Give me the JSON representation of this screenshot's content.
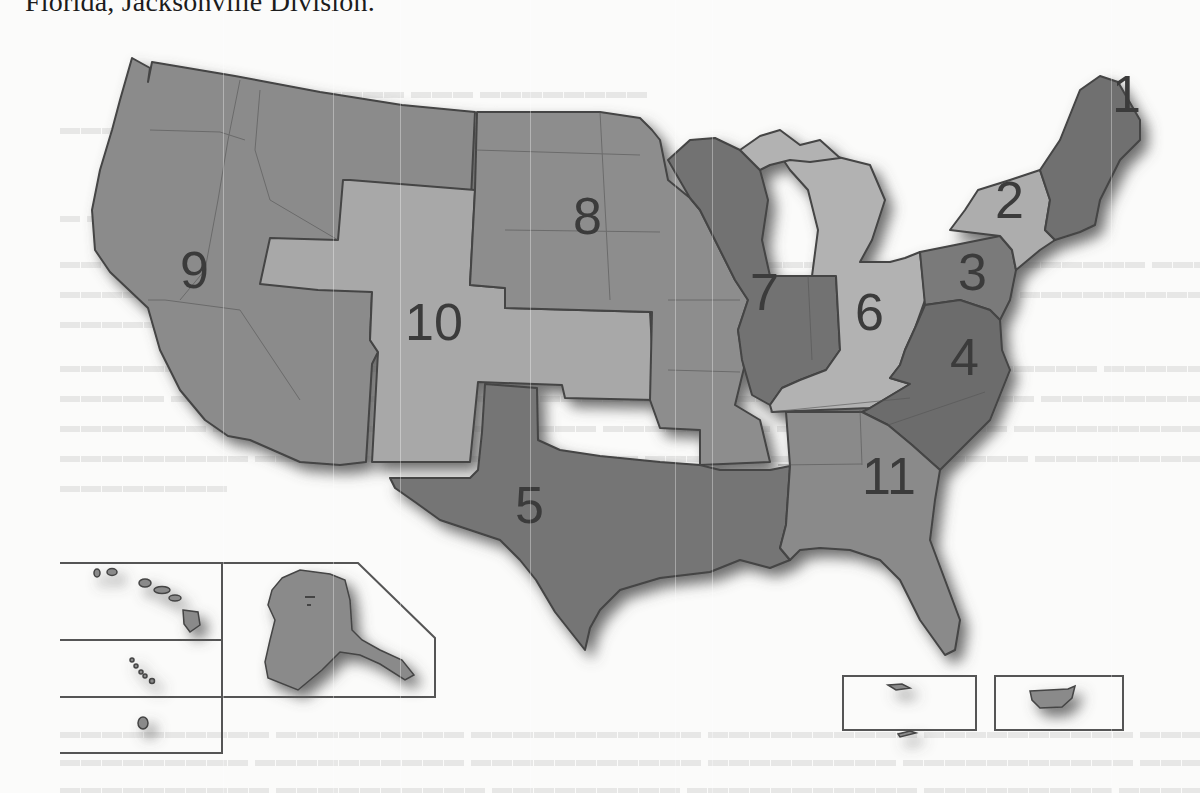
{
  "document": {
    "top_line": "Florida, Jacksonville Division."
  },
  "map": {
    "title": "Geographic Boundaries of the United States Courts of Appeals",
    "colors": {
      "dark": "#6f6f6f",
      "medium": "#8a8a8a",
      "light": "#a9a9a9",
      "border": "#444444",
      "shadow": "#5a5a5a",
      "paper": "#fbfbfa"
    },
    "circuits": [
      {
        "number": "1",
        "shade": "dark"
      },
      {
        "number": "2",
        "shade": "light"
      },
      {
        "number": "3",
        "shade": "dark"
      },
      {
        "number": "4",
        "shade": "dark"
      },
      {
        "number": "5",
        "shade": "dark"
      },
      {
        "number": "6",
        "shade": "light"
      },
      {
        "number": "7",
        "shade": "dark"
      },
      {
        "number": "8",
        "shade": "medium"
      },
      {
        "number": "9",
        "shade": "medium"
      },
      {
        "number": "10",
        "shade": "light"
      },
      {
        "number": "11",
        "shade": "medium"
      }
    ],
    "insets": [
      {
        "name": "hawaii"
      },
      {
        "name": "alaska"
      },
      {
        "name": "northern-mariana-islands"
      },
      {
        "name": "guam"
      },
      {
        "name": "virgin-islands"
      },
      {
        "name": "puerto-rico"
      }
    ]
  }
}
